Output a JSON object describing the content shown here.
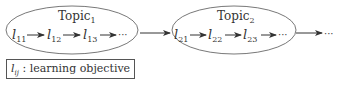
{
  "topics": [
    {
      "title": "Topic",
      "sub": "1",
      "objectives": [
        {
          "base": "l",
          "sub": "11"
        },
        {
          "base": "l",
          "sub": "12"
        },
        {
          "base": "l",
          "sub": "13"
        }
      ]
    },
    {
      "title": "Topic",
      "sub": "2",
      "objectives": [
        {
          "base": "l",
          "sub": "21"
        },
        {
          "base": "l",
          "sub": "22"
        },
        {
          "base": "l",
          "sub": "23"
        }
      ]
    }
  ],
  "ellipsis": "···",
  "legend": {
    "symbol": "l",
    "symbol_sub": "ij",
    "text": " : learning objective"
  },
  "colors": {
    "stroke": "#444444",
    "text": "#333333"
  }
}
